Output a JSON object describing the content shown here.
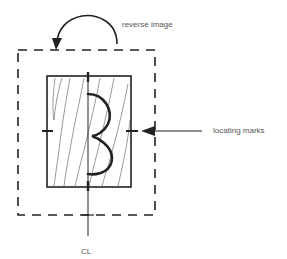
{
  "diagram": {
    "labels": {
      "reverse_image": "reverse image",
      "locating_marks": "locating marks",
      "center_line": "CL"
    },
    "elements": {
      "outer_frame": {
        "style": "dashed",
        "x": 18,
        "y": 50,
        "width": 137,
        "height": 165
      },
      "inner_block": {
        "style": "solid",
        "x": 47,
        "y": 76,
        "width": 84,
        "height": 111,
        "fill": "wood-grain"
      },
      "center_line_x": 88,
      "locating_marks_y": 131,
      "glyph": "reversed-3 curve on center line"
    },
    "colors": {
      "stroke": "#222222",
      "grain": "#555555",
      "text": "#555555",
      "background": "#ffffff"
    }
  }
}
